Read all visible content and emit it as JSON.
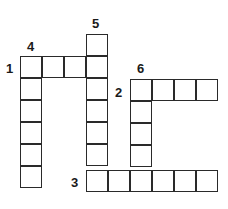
{
  "puzzle": {
    "type": "crossword",
    "clue_numbers": [
      "1",
      "2",
      "3",
      "4",
      "5",
      "6"
    ],
    "words": [
      {
        "number": "1",
        "direction": "across",
        "length": 4
      },
      {
        "number": "2",
        "direction": "across",
        "length": 4
      },
      {
        "number": "3",
        "direction": "across",
        "length": 6
      },
      {
        "number": "4",
        "direction": "down",
        "length": 6
      },
      {
        "number": "5",
        "direction": "down",
        "length": 7
      },
      {
        "number": "6",
        "direction": "down",
        "length": 5
      }
    ],
    "colors": {
      "grid_line": "#2a2a2a",
      "cell_fill": "#ffffff",
      "number": "#1a1a1a"
    }
  }
}
